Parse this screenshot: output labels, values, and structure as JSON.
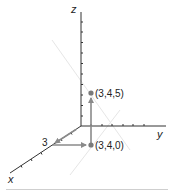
{
  "diagram": {
    "type": "3d-coordinate-axes",
    "axes": {
      "x_label": "x",
      "y_label": "y",
      "z_label": "z"
    },
    "x_tick_label": "3",
    "points": [
      {
        "label": "(3,4,5)",
        "coords": [
          3,
          4,
          5
        ]
      },
      {
        "label": "(3,4,0)",
        "coords": [
          3,
          4,
          0
        ]
      }
    ],
    "arrows": [
      {
        "from": "origin",
        "to": "x=3",
        "description": "along x-axis"
      },
      {
        "from": "x=3",
        "to": "(3,4,0)",
        "description": "parallel to y-axis"
      },
      {
        "from": "(3,4,0)",
        "to": "(3,4,5)",
        "description": "parallel to z-axis"
      }
    ],
    "colors": {
      "axis": "#333333",
      "arrow": "#8a8a8a",
      "point": "#7a7a7a",
      "text": "#222222"
    }
  }
}
